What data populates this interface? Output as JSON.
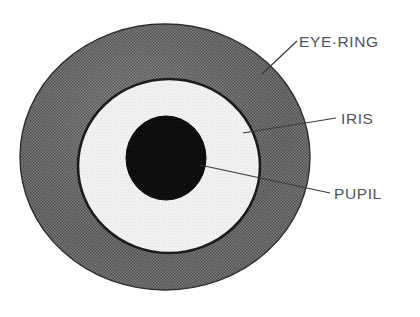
{
  "figure": {
    "name": "eye-anatomy-diagram",
    "background_color": "#ffffff",
    "parts": [
      {
        "id": "eye-ring",
        "label": "EYE·RING",
        "shape": "ellipse",
        "fill_color": "#6e6e6e",
        "outline_color": "#2b2b2b",
        "cx": 165,
        "cy": 157,
        "rx": 145,
        "ry": 133
      },
      {
        "id": "iris",
        "label": "IRIS",
        "shape": "circle",
        "fill_color": "#efefed",
        "outline_color": "#1c1c1c",
        "cx": 169,
        "cy": 166,
        "rx": 91,
        "ry": 87
      },
      {
        "id": "pupil",
        "label": "PUPIL",
        "shape": "circle",
        "fill_color": "#101010",
        "outline_color": "#101010",
        "cx": 166,
        "cy": 158,
        "rx": 40,
        "ry": 42
      }
    ],
    "leader_lines": [
      {
        "id": "leader-eye-ring",
        "x1": 262,
        "y1": 74,
        "x2": 297,
        "y2": 41,
        "color": "#3a3a3a"
      },
      {
        "id": "leader-iris",
        "x1": 243,
        "y1": 133,
        "x2": 336,
        "y2": 118,
        "color": "#3a3a3a"
      },
      {
        "id": "leader-pupil",
        "x1": 200,
        "y1": 165,
        "x2": 330,
        "y2": 193,
        "color": "#3a3a3a"
      }
    ],
    "label_color": "#53535a"
  }
}
